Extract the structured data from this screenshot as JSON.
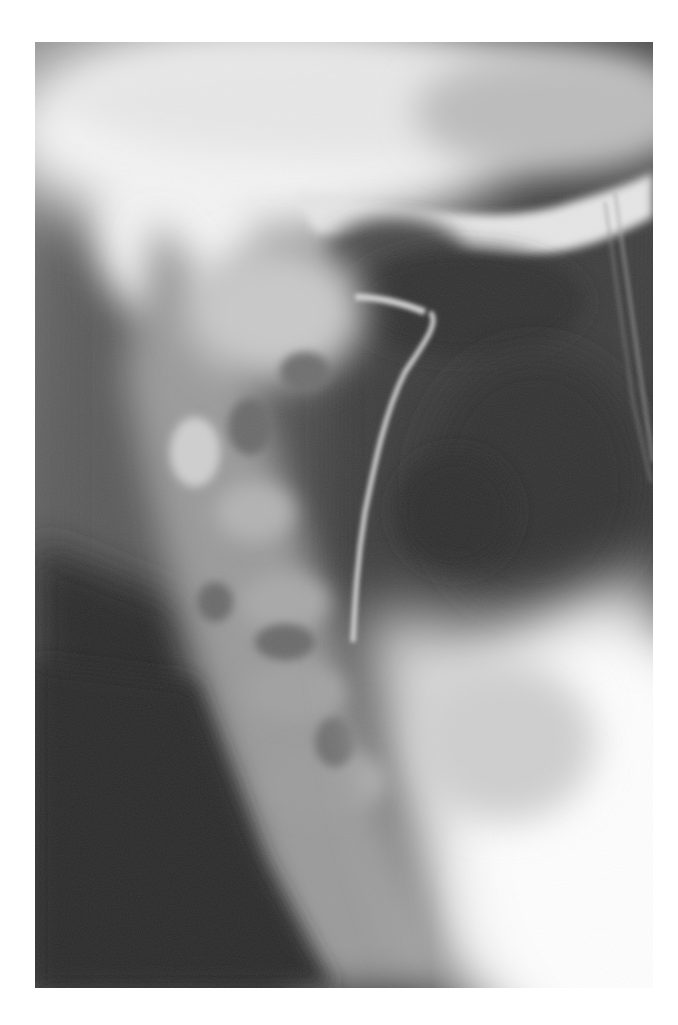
{
  "page": {
    "background": "#ffffff"
  },
  "figure": {
    "type": "radiograph",
    "view": "lateral",
    "region": "skull base and upper cervical spine",
    "frame": {
      "x": 35,
      "y": 42,
      "width": 618,
      "height": 946
    },
    "palette": {
      "bone_bright": "#f4f4f4",
      "bone_mid": "#b8b8b8",
      "soft_tissue": "#7a7a7a",
      "airway_dark": "#3c3c3c",
      "background_dark": "#2a2a2a"
    },
    "caption": ""
  }
}
